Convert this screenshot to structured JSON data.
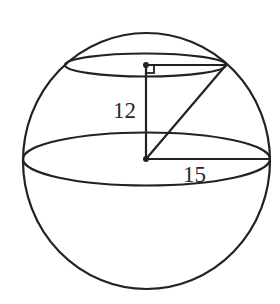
{
  "diagram": {
    "type": "geometry",
    "colors": {
      "line": "#222222",
      "text": "#2a2a2a",
      "background": "#ffffff"
    },
    "labels": {
      "height": "12",
      "radius": "15"
    },
    "elements": [
      "sphere outline",
      "great circle (equator) ellipse",
      "smaller cross-section circle ellipse",
      "vertical segment from sphere center to cross-section center",
      "horizontal radius of sphere",
      "radius of cross-section",
      "segment from sphere center to cross-section edge",
      "right-angle marker",
      "center points"
    ]
  }
}
